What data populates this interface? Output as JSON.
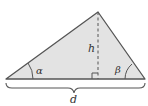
{
  "diagram": {
    "type": "triangle-with-altitude",
    "labels": {
      "height": "h",
      "base": "d",
      "left_angle": "α",
      "right_angle": "β"
    },
    "colors": {
      "fill": "#e3e3e3",
      "stroke": "#555555",
      "text": "#333333"
    }
  }
}
